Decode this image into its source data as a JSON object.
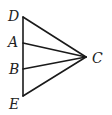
{
  "diagram": {
    "type": "geometry",
    "points": {
      "D": {
        "label": "D",
        "x": 23,
        "y": 17
      },
      "A": {
        "label": "A",
        "x": 23,
        "y": 43
      },
      "B": {
        "label": "B",
        "x": 23,
        "y": 69
      },
      "E": {
        "label": "E",
        "x": 23,
        "y": 96
      },
      "C": {
        "label": "C",
        "x": 86,
        "y": 57
      }
    },
    "segments": [
      [
        "D",
        "E"
      ],
      [
        "D",
        "C"
      ],
      [
        "A",
        "C"
      ],
      [
        "B",
        "C"
      ],
      [
        "E",
        "C"
      ]
    ],
    "line_color": "#1a1a1a"
  }
}
